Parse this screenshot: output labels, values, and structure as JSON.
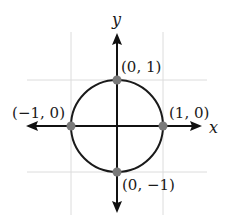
{
  "diagram": {
    "x_axis_label": "x",
    "y_axis_label": "y",
    "circle": {
      "center": [
        0,
        0
      ],
      "radius": 1
    },
    "grid_lines": [
      -1,
      1
    ],
    "points": [
      {
        "x": 0,
        "y": 1,
        "label": "(0, 1)"
      },
      {
        "x": 1,
        "y": 0,
        "label": "(1, 0)"
      },
      {
        "x": -1,
        "y": 0,
        "label": "(−1, 0)"
      },
      {
        "x": 0,
        "y": -1,
        "label": "(0, −1)"
      }
    ],
    "colors": {
      "axis": "#111111",
      "circle": "#1a1a1a",
      "grid": "#dcdcdc",
      "point": "#7a7a7a"
    }
  }
}
